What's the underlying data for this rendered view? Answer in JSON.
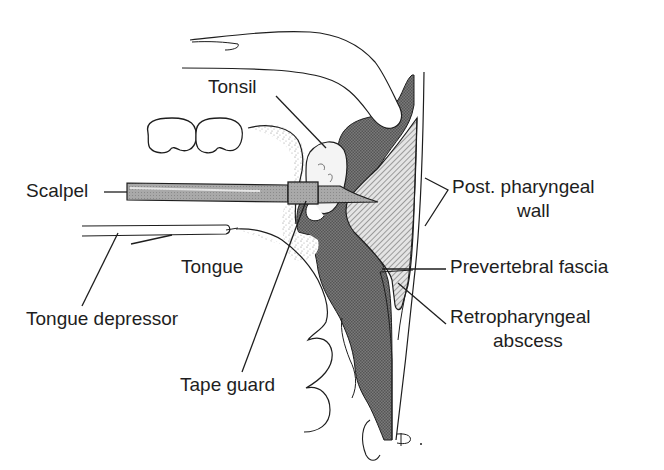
{
  "diagram": {
    "type": "anatomical line drawing",
    "colors": {
      "line": "#1e1e1e",
      "background": "#ffffff",
      "dark_tissue": "#6e6e6e",
      "hatched_tissue": "#bdbdbd",
      "stipple": "#9a9a9a",
      "instrument": "#a8a8a8"
    },
    "labels": {
      "tonsil": "Tonsil",
      "scalpel": "Scalpel",
      "post_pharyngeal_wall_line1": "Post. pharyngeal",
      "post_pharyngeal_wall_line2": "wall",
      "tongue": "Tongue",
      "prevertebral_fascia": "Prevertebral fascia",
      "tongue_depressor": "Tongue depressor",
      "retropharyngeal_abscess_line1": "Retropharyngeal",
      "retropharyngeal_abscess_line2": "abscess",
      "tape_guard": "Tape guard",
      "signature": "Ð."
    }
  }
}
